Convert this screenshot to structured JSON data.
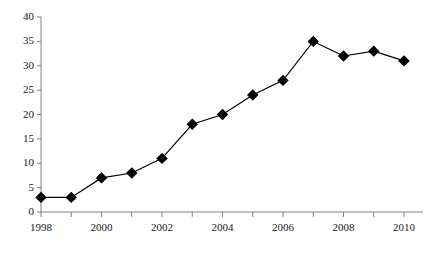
{
  "chart_data": {
    "type": "line",
    "title": "",
    "subtitle": "",
    "xlabel": "",
    "ylabel": "",
    "x": [
      1998,
      1999,
      2000,
      2001,
      2002,
      2003,
      2004,
      2005,
      2006,
      2007,
      2008,
      2009,
      2010
    ],
    "values": [
      3,
      3,
      7,
      8,
      11,
      18,
      20,
      24,
      27,
      35,
      32,
      33,
      31
    ],
    "series": [
      {
        "name": "",
        "values": [
          3,
          3,
          7,
          8,
          11,
          18,
          20,
          24,
          27,
          35,
          32,
          33,
          31
        ]
      }
    ],
    "xlim": [
      1998,
      2010
    ],
    "ylim": [
      0,
      40
    ],
    "x_tick_values": [
      1998,
      1999,
      2000,
      2001,
      2002,
      2003,
      2004,
      2005,
      2006,
      2007,
      2008,
      2009,
      2010
    ],
    "x_tick_labels": [
      "1998",
      "",
      "2000",
      "",
      "2002",
      "",
      "2004",
      "",
      "2006",
      "",
      "2008",
      "",
      "2010"
    ],
    "y_ticks": [
      0,
      5,
      10,
      15,
      20,
      25,
      30,
      35,
      40
    ],
    "y_tick_labels": [
      "0",
      "5",
      "10",
      "15",
      "20",
      "25",
      "30",
      "35",
      "40"
    ],
    "grid": false,
    "legend": false,
    "legend_position": "none",
    "marker": "diamond",
    "line_color": "#000000",
    "marker_color": "#000000",
    "axis_color": "#808080",
    "background_color": "#ffffff",
    "annotations": []
  }
}
